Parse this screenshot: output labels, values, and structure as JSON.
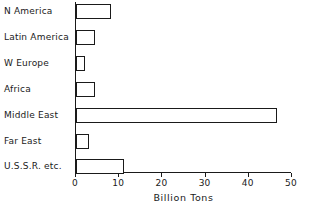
{
  "chart_data": {
    "type": "bar",
    "orientation": "horizontal",
    "title": "",
    "xlabel": "Billion Tons",
    "ylabel": "",
    "xlim": [
      0,
      50
    ],
    "xticks": [
      0,
      10,
      20,
      30,
      40,
      50
    ],
    "xtick_labels": [
      "0",
      "10",
      "20",
      "30",
      "40",
      "50"
    ],
    "grid": false,
    "legend": false,
    "categories": [
      "N America",
      "Latin America",
      "W Europe",
      "Africa",
      "Middle East",
      "Far East",
      "U.S.S.R. etc."
    ],
    "values": [
      8.0,
      4.5,
      2.0,
      4.5,
      46.5,
      3.0,
      11.0
    ],
    "bar_facecolor": "#ffffff",
    "bar_edgecolor": "#1a1a1a",
    "axis_color": "#1a1a1a",
    "background": "#ffffff"
  }
}
